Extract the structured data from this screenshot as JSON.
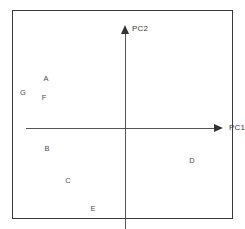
{
  "chart_data": {
    "type": "scatter",
    "title": "",
    "subtitle": "",
    "xlabel": "PC1",
    "ylabel": "PC2",
    "grid": false,
    "legend": false,
    "legend_position": "none",
    "axes_style": "crossed-arrows-at-origin",
    "xlim": [
      -1,
      1
    ],
    "ylim": [
      -1,
      1
    ],
    "xtick_labels": [],
    "ytick_labels": [],
    "annotations": [],
    "point_style": "text-label-only",
    "points": [
      {
        "label": "A",
        "x": -0.61,
        "y": 0.39,
        "px": 45,
        "py": 78
      },
      {
        "label": "G",
        "x": -0.84,
        "y": 0.25,
        "px": 22,
        "py": 92
      },
      {
        "label": "F",
        "x": -0.63,
        "y": 0.2,
        "px": 43,
        "py": 97
      },
      {
        "label": "B",
        "x": -0.6,
        "y": -0.31,
        "px": 46,
        "py": 148
      },
      {
        "label": "C",
        "x": -0.39,
        "y": -0.62,
        "px": 67,
        "py": 180
      },
      {
        "label": "D",
        "x": 0.77,
        "y": -0.43,
        "px": 191,
        "py": 160
      },
      {
        "label": "E",
        "x": -0.17,
        "y": -0.91,
        "px": 92,
        "py": 208
      }
    ]
  },
  "axes": {
    "pc1_label": "PC1",
    "pc2_label": "PC2"
  },
  "colors": {
    "background": "#ffffff",
    "frame": "#3a3a3a",
    "axis": "#555555",
    "arrowhead": "#333333",
    "label_text": "#4a4a4a",
    "axis_label_text": "#3d3d3d"
  }
}
